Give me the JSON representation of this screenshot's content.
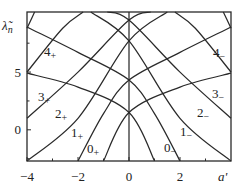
{
  "chart_data": {
    "type": "line",
    "title": "",
    "xlabel": "a'",
    "ylabel": "λ̃n",
    "xlim": [
      -4,
      4
    ],
    "ylim": [
      -2.7,
      10.2
    ],
    "xticks": [
      -4,
      -2,
      0,
      2
    ],
    "xtick_labels": [
      "−4",
      "−2",
      "0",
      "2"
    ],
    "yticks": [
      0,
      5
    ],
    "ytick_labels": [
      "0",
      "5"
    ],
    "grid": false,
    "legend": null,
    "series": [
      {
        "name": "0+",
        "label": "0₊",
        "x": [
          -1.0,
          0,
          2,
          4
        ],
        "y": [
          -2.7,
          1.5,
          3.7,
          4.9
        ]
      },
      {
        "name": "1+",
        "label": "1₊",
        "x": [
          -2.0,
          -1,
          0,
          2,
          4
        ],
        "y": [
          -2.7,
          1.4,
          4.3,
          6.7,
          8.9
        ]
      },
      {
        "name": "2+",
        "label": "2₊",
        "x": [
          -4,
          -2,
          0,
          1.5
        ],
        "y": [
          -2.7,
          1.0,
          7.7,
          10.2
        ]
      },
      {
        "name": "3+",
        "label": "3₊",
        "x": [
          -4,
          -2,
          0,
          0.85
        ],
        "y": [
          1.0,
          5.0,
          9.5,
          10.2
        ]
      },
      {
        "name": "4+",
        "label": "4₊",
        "x": [
          -4,
          -2.6,
          -1.8
        ],
        "y": [
          5.0,
          8.8,
          10.2
        ]
      },
      {
        "name": "5+",
        "label": "",
        "x": [
          -4,
          -3.7
        ],
        "y": [
          8.8,
          10.2
        ]
      },
      {
        "name": "0-",
        "label": "0₋",
        "x": [
          1.0,
          0,
          -2,
          -4
        ],
        "y": [
          -2.7,
          1.5,
          3.7,
          4.9
        ]
      },
      {
        "name": "1-",
        "label": "1₋",
        "x": [
          2.0,
          1,
          0,
          -2,
          -4
        ],
        "y": [
          -2.7,
          1.4,
          4.3,
          6.7,
          8.9
        ]
      },
      {
        "name": "2-",
        "label": "2₋",
        "x": [
          4,
          2,
          0,
          -1.5
        ],
        "y": [
          -2.7,
          1.0,
          7.7,
          10.2
        ]
      },
      {
        "name": "3-",
        "label": "3₋",
        "x": [
          4,
          2,
          0,
          -0.85
        ],
        "y": [
          1.0,
          5.0,
          9.5,
          10.2
        ]
      },
      {
        "name": "4-",
        "label": "4₋",
        "x": [
          4,
          2.6,
          1.8
        ],
        "y": [
          5.0,
          8.8,
          10.2
        ]
      },
      {
        "name": "5-",
        "label": "",
        "x": [
          4,
          3.7
        ],
        "y": [
          8.8,
          10.2
        ]
      }
    ],
    "center_line": {
      "x": 0
    }
  },
  "labels": {
    "ylabel_main": "λ̃",
    "ylabel_sub": "n",
    "xlabel": "a'",
    "curve_labels": [
      {
        "num": "4",
        "sign": "+",
        "x": 44,
        "y": 56
      },
      {
        "num": "3",
        "sign": "+",
        "x": 38,
        "y": 101
      },
      {
        "num": "2",
        "sign": "+",
        "x": 55,
        "y": 118
      },
      {
        "num": "1",
        "sign": "+",
        "x": 71,
        "y": 137
      },
      {
        "num": "0",
        "sign": "+",
        "x": 87,
        "y": 153
      },
      {
        "num": "4",
        "sign": "−",
        "x": 213,
        "y": 57
      },
      {
        "num": "3",
        "sign": "−",
        "x": 212,
        "y": 98
      },
      {
        "num": "2",
        "sign": "−",
        "x": 197,
        "y": 117
      },
      {
        "num": "1",
        "sign": "−",
        "x": 180,
        "y": 136
      },
      {
        "num": "0",
        "sign": "−",
        "x": 164,
        "y": 152
      }
    ]
  }
}
